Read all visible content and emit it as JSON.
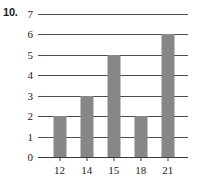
{
  "exercise": {
    "number": "10."
  },
  "chart_data": {
    "type": "bar",
    "title": "",
    "subtitle": "",
    "xlabel": "",
    "ylabel": "",
    "categories": [
      "12",
      "14",
      "15",
      "18",
      "21"
    ],
    "values": [
      2,
      3,
      5,
      2,
      6
    ],
    "ylim": [
      0,
      7
    ],
    "ytick_labels": [
      "0",
      "1",
      "2",
      "3",
      "4",
      "5",
      "6",
      "7"
    ],
    "ytick_values": [
      0,
      1,
      2,
      3,
      4,
      5,
      6,
      7
    ],
    "grid": true,
    "grid_axis": "y",
    "legend": false,
    "legend_position": "none",
    "bar_color": "#878787",
    "grid_color": "#4d4d4d",
    "axis_color": "#3a3a3a",
    "text_color": "#1a1a1a",
    "background_color": "#ffffff"
  }
}
